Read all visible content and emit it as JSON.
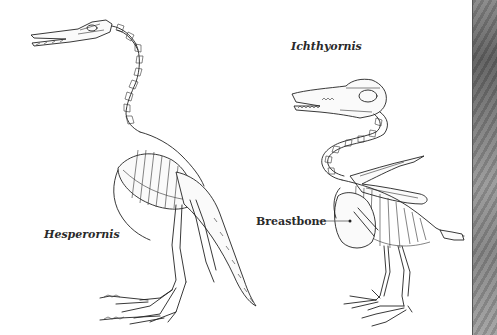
{
  "figure": {
    "labels": {
      "hesperornis": "Hesperornis",
      "ichthyornis": "Ichthyornis",
      "breastbone": "Breastbone"
    },
    "specimens": [
      {
        "name": "Hesperornis",
        "description": "skeleton of a toothed diving bird, long neck, upright stance"
      },
      {
        "name": "Ichthyornis",
        "description": "skeleton of a toothed flying bird with keeled breastbone"
      }
    ],
    "callouts": [
      {
        "label": "Breastbone",
        "target": "Ichthyornis sternum"
      }
    ],
    "colors": {
      "background": "#ffffff",
      "ink": "#222222",
      "side_panel": "#7a7a7a"
    }
  }
}
